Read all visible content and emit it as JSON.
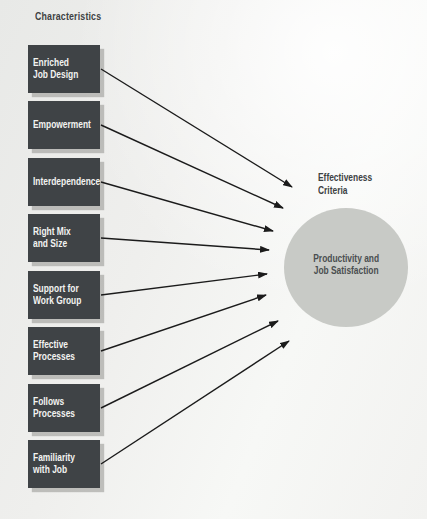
{
  "title": "Characteristics",
  "effectiveness": {
    "label": "Effectiveness\nCriteria"
  },
  "outcome": {
    "label": "Productivity and\nJob Satisfaction"
  },
  "colors": {
    "box_bg": "#3f4346",
    "box_text": "#f3f3f1",
    "circle_fill": "#c8cac6",
    "circle_text": "#4a4e50",
    "heading_text": "#3d4143",
    "arrow": "#1b1b1b"
  },
  "boxes": [
    {
      "label": "Enriched\nJob Design",
      "top": 45,
      "arrow": {
        "x1": 101,
        "y1": 69,
        "x2": 292,
        "y2": 187
      }
    },
    {
      "label": "Empowerment",
      "top": 101,
      "arrow": {
        "x1": 101,
        "y1": 125,
        "x2": 283,
        "y2": 208
      }
    },
    {
      "label": "Interdependence",
      "top": 158,
      "arrow": {
        "x1": 101,
        "y1": 182,
        "x2": 273,
        "y2": 231
      }
    },
    {
      "label": "Right Mix\nand Size",
      "top": 214,
      "arrow": {
        "x1": 101,
        "y1": 238,
        "x2": 269,
        "y2": 250
      }
    },
    {
      "label": "Support for\nWork Group",
      "top": 271,
      "arrow": {
        "x1": 101,
        "y1": 295,
        "x2": 267,
        "y2": 274
      }
    },
    {
      "label": "Effective\nProcesses",
      "top": 327,
      "arrow": {
        "x1": 101,
        "y1": 351,
        "x2": 266,
        "y2": 295
      }
    },
    {
      "label": "Follows\nProcesses",
      "top": 384,
      "arrow": {
        "x1": 101,
        "y1": 408,
        "x2": 278,
        "y2": 321
      }
    },
    {
      "label": "Familiarity\nwith Job",
      "top": 440,
      "arrow": {
        "x1": 101,
        "y1": 464,
        "x2": 289,
        "y2": 341
      }
    }
  ]
}
